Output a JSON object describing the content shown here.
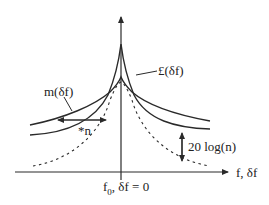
{
  "diagram": {
    "type": "phase-noise-spectrum",
    "colors": {
      "stroke": "#2a2a2a",
      "background": "#ffffff"
    },
    "axes": {
      "x_label": "f, δf",
      "origin_label_main": "f",
      "origin_label_sub": "0",
      "origin_label_rest": ", δf = 0"
    },
    "curves": [
      {
        "name": "L(δf)",
        "label": "£(δf)",
        "style": "solid",
        "description": "sharp peaked spectrum (multiplied)"
      },
      {
        "name": "m(δf)",
        "label": "m(δf)",
        "style": "solid",
        "description": "broader spectrum"
      },
      {
        "name": "reference",
        "label": "",
        "style": "dashed",
        "description": "original spectrum"
      }
    ],
    "annotations": {
      "width_scale": "*n",
      "level_offset": "20 log(n)"
    }
  }
}
